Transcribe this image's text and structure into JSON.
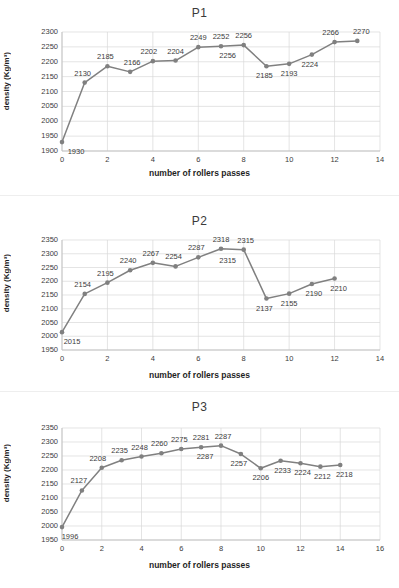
{
  "page": {
    "background": "#ffffff",
    "series_color": "#808080",
    "grid_color": "#d9d9d9",
    "axis_color": "#bfbfbf"
  },
  "charts": [
    {
      "id": "p1",
      "title": "P1",
      "xlabel": "number of rollers passes",
      "ylabel": "density (Kg/m³)",
      "yticks": [
        1900,
        1950,
        2000,
        2050,
        2100,
        2150,
        2200,
        2250,
        2300
      ],
      "xticks": [
        0,
        2,
        4,
        6,
        8,
        10,
        12,
        14
      ],
      "chart_data": {
        "type": "line",
        "title": "P1",
        "xlabel": "number of rollers passes",
        "ylabel": "density (Kg/m³)",
        "xlim": [
          0,
          14
        ],
        "ylim": [
          1900,
          2300
        ],
        "grid": true,
        "legend": "none",
        "x": [
          0,
          1,
          2,
          3,
          4,
          5,
          6,
          7,
          8,
          9,
          10,
          11,
          12,
          13
        ],
        "values": [
          1930,
          2130,
          2185,
          2166,
          2202,
          2204,
          2249,
          2252,
          2256,
          2185,
          2193,
          2224,
          2266,
          2270
        ],
        "point_labels": [
          "1930",
          "2130",
          "2185",
          "2166",
          "2202",
          "2204",
          "2249",
          "2252",
          "2256",
          "2185",
          "2193",
          "2224",
          "2266",
          "2270"
        ],
        "extra_annotation": {
          "text": "2256",
          "x": 8,
          "note": "duplicate label below the x=8 point"
        }
      }
    },
    {
      "id": "p2",
      "title": "P2",
      "xlabel": "number of rollers passes",
      "ylabel": "density (Kg/m³)",
      "yticks": [
        1950,
        2000,
        2050,
        2100,
        2150,
        2200,
        2250,
        2300,
        2350
      ],
      "xticks": [
        0,
        2,
        4,
        6,
        8,
        10,
        12,
        14
      ],
      "chart_data": {
        "type": "line",
        "title": "P2",
        "xlabel": "number of rollers passes",
        "ylabel": "density (Kg/m³)",
        "xlim": [
          0,
          14
        ],
        "ylim": [
          1950,
          2350
        ],
        "grid": true,
        "legend": "none",
        "x": [
          0,
          1,
          2,
          3,
          4,
          5,
          6,
          7,
          8,
          9,
          10,
          11,
          12
        ],
        "values": [
          2015,
          2154,
          2195,
          2240,
          2267,
          2254,
          2287,
          2318,
          2315,
          2137,
          2155,
          2190,
          2210
        ],
        "point_labels": [
          "2015",
          "2154",
          "2195",
          "2240",
          "2267",
          "2254",
          "2287",
          "2318",
          "2315",
          "2137",
          "2155",
          "2190",
          "2210"
        ],
        "extra_annotation": {
          "text": "2315",
          "x": 8,
          "note": "duplicate label below the x=8 point"
        }
      }
    },
    {
      "id": "p3",
      "title": "P3",
      "xlabel": "number of rollers passes",
      "ylabel": "density (Kg/m³)",
      "yticks": [
        1950,
        2000,
        2050,
        2100,
        2150,
        2200,
        2250,
        2300,
        2350
      ],
      "xticks": [
        0,
        2,
        4,
        6,
        8,
        10,
        12,
        14,
        16
      ],
      "chart_data": {
        "type": "line",
        "title": "P3",
        "xlabel": "number of rollers passes",
        "ylabel": "density (Kg/m³)",
        "xlim": [
          0,
          16
        ],
        "ylim": [
          1950,
          2350
        ],
        "grid": true,
        "legend": "none",
        "x": [
          0,
          1,
          2,
          3,
          4,
          5,
          6,
          7,
          8,
          9,
          10,
          11,
          12,
          13,
          14
        ],
        "values": [
          1996,
          2127,
          2208,
          2235,
          2248,
          2260,
          2275,
          2281,
          2287,
          2257,
          2206,
          2233,
          2224,
          2212,
          2218
        ],
        "point_labels": [
          "1996",
          "2127",
          "2208",
          "2235",
          "2248",
          "2260",
          "2275",
          "2281",
          "2287",
          "2257",
          "2206",
          "2233",
          "2224",
          "2212",
          "2218"
        ],
        "extra_annotation": {
          "text": "2287",
          "x": 8,
          "note": "duplicate label below the x=8 point"
        }
      }
    }
  ]
}
